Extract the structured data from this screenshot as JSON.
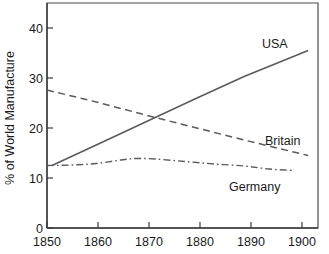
{
  "chart_data": {
    "type": "line",
    "title": "",
    "subtitle": "",
    "xlabel": "",
    "ylabel": "% of World Manufacture",
    "xlim": [
      1850,
      1905
    ],
    "ylim": [
      0,
      45
    ],
    "xticks": [
      1850,
      1860,
      1870,
      1880,
      1890,
      1900
    ],
    "xtick_labels": [
      "1850",
      "1860",
      "1870",
      "1880",
      "1890",
      "1900"
    ],
    "yticks": [
      0,
      10,
      20,
      30,
      40
    ],
    "ytick_labels": [
      "0",
      "10",
      "20",
      "30",
      "40"
    ],
    "grid": false,
    "legend_position": "inline-annotations",
    "series": [
      {
        "name": "USA",
        "style": "solid",
        "color": "#5a5a62",
        "label_x": 1897,
        "label_y": 38.2,
        "x": [
          1851,
          1860,
          1870,
          1880,
          1890,
          1903
        ],
        "values": [
          12.5,
          16.6,
          21.2,
          25.8,
          30.3,
          35.5
        ]
      },
      {
        "name": "Britain",
        "style": "dashed",
        "color": "#5a5a62",
        "label_x": 1894,
        "label_y": 19.6,
        "x": [
          1850,
          1860,
          1870,
          1880,
          1890,
          1903
        ],
        "values": [
          27.6,
          25.2,
          22.6,
          20.1,
          17.6,
          14.5
        ]
      },
      {
        "name": "Germany",
        "style": "dash-dot",
        "color": "#5a5a62",
        "label_x": 1884,
        "label_y": 9.4,
        "x": [
          1850,
          1855,
          1860,
          1865,
          1868,
          1872,
          1878,
          1884,
          1890,
          1895,
          1900
        ],
        "values": [
          12.5,
          12.6,
          12.9,
          13.6,
          13.9,
          13.8,
          13.3,
          12.8,
          12.4,
          11.8,
          11.5
        ]
      }
    ]
  }
}
